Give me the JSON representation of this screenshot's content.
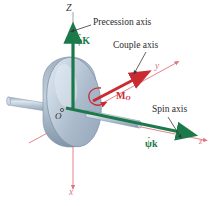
{
  "figure": {
    "background_color": "#ffffff"
  },
  "colors": {
    "precession_vector": "#1c7a4a",
    "spin_vector": "#1c7a4a",
    "couple_moment": "#c92b33",
    "coordinate_axis": "#e0757e",
    "leader_line": "#3a3a3a",
    "disk_body": "#b9c6d6",
    "disk_rim": "#8b9bb0",
    "shaft": "#aebccd",
    "text_dark": "#2b2b2b"
  },
  "annotations": {
    "precession_axis": "Precession axis",
    "couple_axis": "Couple axis",
    "spin_axis": "Spin axis"
  },
  "axis_labels": {
    "big_z": "Z",
    "x": "x",
    "y": "y",
    "z": "z"
  },
  "vector_labels": {
    "precession": {
      "symbol": "φ",
      "unit": "K",
      "dot": "·",
      "full": "φ̇K"
    },
    "spin": {
      "symbol": "ψ",
      "unit": "k",
      "dot": "·",
      "full": "ψ̇k"
    },
    "moment": {
      "symbol": "M",
      "subscript": "O",
      "full": "Mₒ"
    }
  },
  "points": {
    "origin": "O"
  }
}
